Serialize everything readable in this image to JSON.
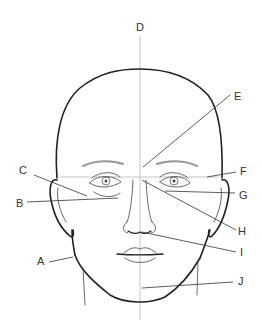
{
  "diagram": {
    "labels": [
      {
        "id": "A",
        "text": "A",
        "x": 37,
        "y": 265
      },
      {
        "id": "B",
        "text": "B",
        "x": 16,
        "y": 207
      },
      {
        "id": "C",
        "text": "C",
        "x": 19,
        "y": 174
      },
      {
        "id": "D",
        "text": "D",
        "x": 136,
        "y": 31
      },
      {
        "id": "E",
        "text": "E",
        "x": 234,
        "y": 100
      },
      {
        "id": "F",
        "text": "F",
        "x": 240,
        "y": 175
      },
      {
        "id": "G",
        "text": "G",
        "x": 239,
        "y": 199
      },
      {
        "id": "H",
        "text": "H",
        "x": 238,
        "y": 235
      },
      {
        "id": "I",
        "text": "I",
        "x": 240,
        "y": 256
      },
      {
        "id": "J",
        "text": "J",
        "x": 238,
        "y": 285
      }
    ],
    "colors": {
      "outline": "#222222",
      "guide": "#bdbdbd",
      "leader": "#333333",
      "background": "#ffffff"
    }
  }
}
